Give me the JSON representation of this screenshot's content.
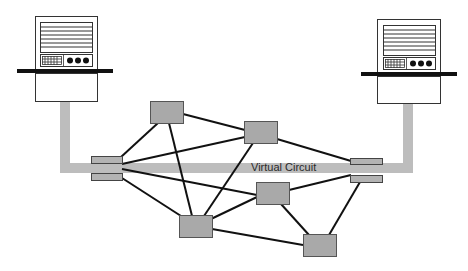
{
  "diagram": {
    "virtual_circuit_label": "Virtual Circuit",
    "colors": {
      "background": "#ffffff",
      "circuit_band": "#bdbdbd",
      "node_fill": "#a9a9a9",
      "node_stroke": "#555555",
      "link": "#111111",
      "host_stroke": "#222222",
      "host_bar": "#111111"
    },
    "hosts": [
      {
        "id": "host-left",
        "x": 35,
        "y": 16,
        "w": 62,
        "h": 85,
        "bar": {
          "x": 17,
          "w": 96
        }
      },
      {
        "id": "host-right",
        "x": 377,
        "y": 19,
        "w": 63,
        "h": 84,
        "bar": {
          "x": 361,
          "w": 96
        }
      }
    ],
    "switches": [
      {
        "id": "node-1",
        "x": 150,
        "y": 101,
        "w": 33,
        "h": 22
      },
      {
        "id": "node-2",
        "x": 244,
        "y": 121,
        "w": 33,
        "h": 22
      },
      {
        "id": "node-3",
        "x": 256,
        "y": 182,
        "w": 33,
        "h": 22
      },
      {
        "id": "node-4",
        "x": 179,
        "y": 215,
        "w": 33,
        "h": 22
      },
      {
        "id": "node-5",
        "x": 303,
        "y": 234,
        "w": 33,
        "h": 22
      }
    ],
    "edge_switches": [
      {
        "id": "edge-left",
        "x": 91,
        "y": 156,
        "w": 31
      },
      {
        "id": "edge-right",
        "x": 350,
        "y": 158,
        "w": 32
      }
    ],
    "links": [
      {
        "from": "edge-left",
        "to": "node-1"
      },
      {
        "from": "edge-left",
        "to": "node-2"
      },
      {
        "from": "edge-left",
        "to": "node-3"
      },
      {
        "from": "edge-left",
        "to": "node-4"
      },
      {
        "from": "node-1",
        "to": "node-2"
      },
      {
        "from": "node-1",
        "to": "node-4"
      },
      {
        "from": "node-2",
        "to": "edge-right"
      },
      {
        "from": "node-2",
        "to": "node-4"
      },
      {
        "from": "node-3",
        "to": "edge-right"
      },
      {
        "from": "node-3",
        "to": "node-4"
      },
      {
        "from": "node-3",
        "to": "node-5"
      },
      {
        "from": "node-4",
        "to": "node-5"
      },
      {
        "from": "edge-right",
        "to": "node-5"
      }
    ]
  }
}
